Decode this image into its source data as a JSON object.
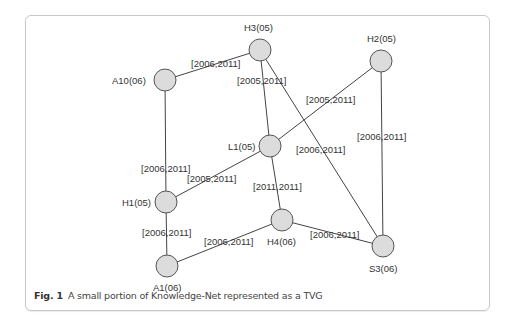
{
  "caption": {
    "fig_label": "Fig. 1",
    "text": "A small portion of Knowledge-Net represented as a TVG"
  },
  "colors": {
    "node_fill": "#dcdcdc",
    "node_stroke": "#555555",
    "edge": "#444444",
    "frame_border": "#c8c8c8"
  },
  "graph": {
    "nodes": [
      {
        "id": "H3",
        "label": "H3(05)",
        "x": 260,
        "y": 50
      },
      {
        "id": "A10",
        "label": "A10(06)",
        "x": 165,
        "y": 80
      },
      {
        "id": "H2",
        "label": "H2(05)",
        "x": 381,
        "y": 61
      },
      {
        "id": "L1",
        "label": "L1(05)",
        "x": 270,
        "y": 146
      },
      {
        "id": "H1",
        "label": "H1(05)",
        "x": 166,
        "y": 202
      },
      {
        "id": "H4",
        "label": "H4(06)",
        "x": 282,
        "y": 220
      },
      {
        "id": "A1",
        "label": "A1(06)",
        "x": 167,
        "y": 266
      },
      {
        "id": "S3",
        "label": "S3(06)",
        "x": 383,
        "y": 246
      }
    ],
    "edges": [
      {
        "from": "A10",
        "to": "H3",
        "label": "[2006,2011]"
      },
      {
        "from": "H3",
        "to": "L1",
        "label": "[2005,2011]"
      },
      {
        "from": "H3",
        "to": "S3",
        "label": "[2006,2011]"
      },
      {
        "from": "H2",
        "to": "L1",
        "label": "[2005,2011]"
      },
      {
        "from": "H2",
        "to": "S3",
        "label": "[2006,2011]"
      },
      {
        "from": "A10",
        "to": "H1",
        "label": "[2006,2011]"
      },
      {
        "from": "L1",
        "to": "H1",
        "label": "[2005,2011]"
      },
      {
        "from": "L1",
        "to": "H4",
        "label": "[2011,2011]"
      },
      {
        "from": "H1",
        "to": "A1",
        "label": "[2006,2011]"
      },
      {
        "from": "A1",
        "to": "H4",
        "label": "[2006,2011]"
      },
      {
        "from": "H4",
        "to": "S3",
        "label": "[2006,2011]"
      }
    ]
  }
}
